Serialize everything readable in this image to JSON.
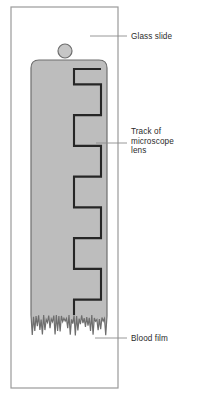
{
  "figure": {
    "background_color": "#ffffff"
  },
  "colors": {
    "slide_border": "#9a9a9a",
    "slide_fill": "#ffffff",
    "film_fill": "#bdbdbd",
    "film_border": "#6e6e6e",
    "film_outline_dark": "#555555",
    "track_line": "#262626",
    "drop_fill": "#c6c6c6",
    "drop_border": "#6e6e6e",
    "leader_line": "#8c8c8c",
    "text": "#2b2b2b"
  },
  "slide": {
    "name": "glass slide",
    "x": 11,
    "y": 7,
    "width": 107,
    "height": 381
  },
  "blood_drop": {
    "name": "blood drop",
    "cx": 65,
    "cy": 51,
    "r": 7
  },
  "blood_film": {
    "name": "blood film",
    "x": 31,
    "y": 60,
    "width": 76,
    "corner_radius": 8,
    "feather_top": 316
  },
  "track": {
    "name": "track of microscope lens",
    "stroke_width": 2.1,
    "x_left": 74,
    "x_right": 101,
    "y_start": 69,
    "y_end": 315,
    "steps": 8
  },
  "labels": [
    {
      "id": "glass-slide",
      "text": "Glass slide",
      "lines": [
        "Glass slide"
      ],
      "text_x": 131,
      "text_y": 39,
      "leader": {
        "x1": 90,
        "y1": 36,
        "x2": 127,
        "y2": 36
      }
    },
    {
      "id": "track-of-microscope-lens",
      "text": "Track of microscope lens",
      "lines": [
        "Track of",
        "microscope",
        "lens"
      ],
      "text_x": 131,
      "text_y": 134,
      "line_height": 9.5,
      "leader": {
        "x1": 96,
        "y1": 143,
        "x2": 127,
        "y2": 143
      }
    },
    {
      "id": "blood-film",
      "text": "Blood film",
      "lines": [
        "Blood film"
      ],
      "text_x": 131,
      "text_y": 341,
      "leader": {
        "x1": 95,
        "y1": 338,
        "x2": 127,
        "y2": 338
      }
    }
  ]
}
